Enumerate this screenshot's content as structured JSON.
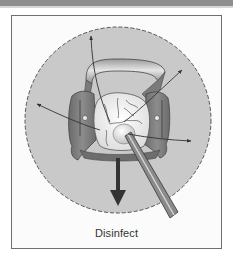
{
  "figure": {
    "caption": "Disinfect",
    "colors": {
      "top_bar": "#8e8e8e",
      "frame_border": "#6f6f6f",
      "frame_bg": "#fbfbfb",
      "circle_fill": "#c9c9c9",
      "circle_dash": "#555555",
      "clamp_fill": "#7d7d7d",
      "clamp_dark": "#5a5a5a",
      "tooth_fill": "#f2f2f2",
      "arrow": "#333333",
      "instrument": "#8a8a8a"
    },
    "elements": {
      "circle": {
        "cx": 118,
        "cy": 120,
        "r": 93
      },
      "arrows": [
        {
          "name": "arrow-up",
          "from": [
            108,
            120
          ],
          "to": [
            91,
            36
          ]
        },
        {
          "name": "arrow-upper-right",
          "from": [
            125,
            120
          ],
          "to": [
            182,
            70
          ]
        },
        {
          "name": "arrow-left",
          "from": [
            100,
            128
          ],
          "to": [
            37,
            104
          ]
        },
        {
          "name": "arrow-right",
          "from": [
            130,
            132
          ],
          "to": [
            191,
            141
          ]
        }
      ],
      "bold_arrow": {
        "name": "bold-arrow-down",
        "x": 118,
        "y1": 158,
        "y2": 206
      }
    }
  }
}
